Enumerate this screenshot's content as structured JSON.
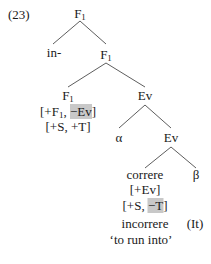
{
  "example_number": "(23)",
  "tree": {
    "root": {
      "label": "F",
      "sub": "1"
    },
    "prefix": "in-",
    "f1_mid": {
      "label": "F",
      "sub": "1"
    },
    "f1_low": {
      "label": "F",
      "sub": "1"
    },
    "f1_low_features": {
      "line1_a": "[+F",
      "line1_sub": "1",
      "line1_b": ", ",
      "line1_highlight": "−Ev",
      "line1_c": "]",
      "line2": "[+S, +T]"
    },
    "ev_upper": "Ev",
    "alpha": "α",
    "ev_lower": "Ev",
    "verb": "correre",
    "beta": "β",
    "verb_features": {
      "line1": "[+Ev]",
      "line2_a": "[+S, ",
      "line2_highlight": "−T",
      "line2_b": "]"
    },
    "gloss_word": "incorrere",
    "language": "(It)",
    "translation": "‘to run into’"
  },
  "colors": {
    "highlight": "#c8c8c8",
    "lines": "#333333"
  }
}
